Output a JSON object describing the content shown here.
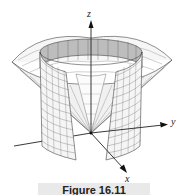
{
  "figure": {
    "axes": {
      "x_label": "x",
      "y_label": "y",
      "z_label": "z"
    },
    "caption": "Figure 16.11",
    "colors": {
      "mesh_line": "#555555",
      "surface_fill": "#f4f4f4",
      "inner_fill": "#cfcfcf",
      "axis": "#222222",
      "caption_bg": "#e9e9e9"
    }
  }
}
